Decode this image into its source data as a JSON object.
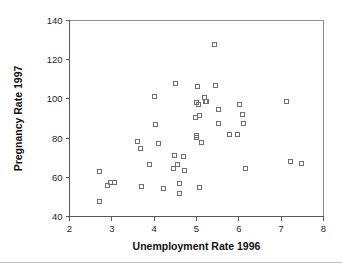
{
  "chart_data": {
    "type": "scatter",
    "title": "",
    "xlabel": "Unemployment Rate 1996",
    "ylabel": "Pregnancy Rate 1997",
    "xlim": [
      2,
      8
    ],
    "ylim": [
      40,
      140
    ],
    "xticks": [
      2,
      3,
      4,
      5,
      6,
      7,
      8
    ],
    "yticks": [
      40,
      60,
      80,
      100,
      120,
      140
    ],
    "xtick_labels": [
      "2",
      "3",
      "4",
      "5",
      "6",
      "7",
      "8"
    ],
    "ytick_labels": [
      "40",
      "60",
      "80",
      "100",
      "120",
      "140"
    ],
    "grid": false,
    "legend": null,
    "marker": "open-square",
    "marker_color": "#6f6f74",
    "points": [
      {
        "x": 2.7,
        "y": 63.0
      },
      {
        "x": 2.7,
        "y": 48.0
      },
      {
        "x": 2.88,
        "y": 56.0
      },
      {
        "x": 2.97,
        "y": 57.8
      },
      {
        "x": 3.05,
        "y": 57.8
      },
      {
        "x": 3.6,
        "y": 78.3
      },
      {
        "x": 3.67,
        "y": 74.8
      },
      {
        "x": 3.68,
        "y": 55.3
      },
      {
        "x": 3.88,
        "y": 66.7
      },
      {
        "x": 4.0,
        "y": 101.5
      },
      {
        "x": 4.02,
        "y": 87.0
      },
      {
        "x": 4.1,
        "y": 77.5
      },
      {
        "x": 4.2,
        "y": 54.5
      },
      {
        "x": 4.45,
        "y": 64.5
      },
      {
        "x": 4.48,
        "y": 71.3
      },
      {
        "x": 4.5,
        "y": 108.0
      },
      {
        "x": 4.55,
        "y": 66.8
      },
      {
        "x": 4.58,
        "y": 57.0
      },
      {
        "x": 4.6,
        "y": 52.0
      },
      {
        "x": 4.68,
        "y": 70.7
      },
      {
        "x": 4.7,
        "y": 63.8
      },
      {
        "x": 4.97,
        "y": 90.8
      },
      {
        "x": 5.0,
        "y": 98.2
      },
      {
        "x": 5.0,
        "y": 81.5
      },
      {
        "x": 5.0,
        "y": 80.5
      },
      {
        "x": 5.02,
        "y": 106.7
      },
      {
        "x": 5.03,
        "y": 97.5
      },
      {
        "x": 5.05,
        "y": 91.5
      },
      {
        "x": 5.05,
        "y": 55.0
      },
      {
        "x": 5.1,
        "y": 77.8
      },
      {
        "x": 5.18,
        "y": 101.0
      },
      {
        "x": 5.2,
        "y": 98.8
      },
      {
        "x": 5.22,
        "y": 99.0
      },
      {
        "x": 5.42,
        "y": 128.0
      },
      {
        "x": 5.45,
        "y": 107.2
      },
      {
        "x": 5.5,
        "y": 95.0
      },
      {
        "x": 5.52,
        "y": 87.7
      },
      {
        "x": 5.78,
        "y": 82.0
      },
      {
        "x": 5.95,
        "y": 81.8
      },
      {
        "x": 6.0,
        "y": 97.3
      },
      {
        "x": 6.08,
        "y": 92.2
      },
      {
        "x": 6.1,
        "y": 87.8
      },
      {
        "x": 6.15,
        "y": 64.5
      },
      {
        "x": 7.12,
        "y": 99.0
      },
      {
        "x": 7.22,
        "y": 68.5
      },
      {
        "x": 7.48,
        "y": 67.3
      }
    ]
  }
}
